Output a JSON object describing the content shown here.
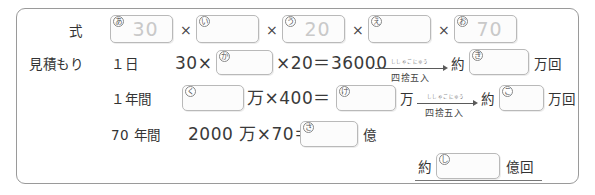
{
  "worksheet": {
    "row_labels": {
      "shiki": "式",
      "mitsumori": "見積もり"
    },
    "rows": [
      {
        "id": "shiki",
        "label": "式",
        "boxes": [
          {
            "tag": "あ",
            "value": "30"
          },
          {
            "tag": "い",
            "value": ""
          },
          {
            "tag": "う",
            "value": "20"
          },
          {
            "tag": "え",
            "value": ""
          },
          {
            "tag": "お",
            "value": "70"
          }
        ],
        "operators": [
          "×",
          "×",
          "×",
          "×"
        ]
      },
      {
        "id": "one-day",
        "period": "１日",
        "expr_a": "30×",
        "box1": {
          "tag": "か",
          "value": ""
        },
        "expr_b": "×20＝36000",
        "arrow_label": "四捨五入",
        "arrow_furigana": "ししゃごにゅう",
        "approx": "約",
        "box2": {
          "tag": "き",
          "value": ""
        },
        "unit": "万回"
      },
      {
        "id": "one-year",
        "period": "１年間",
        "box1": {
          "tag": "く",
          "value": ""
        },
        "expr_a": "万×400＝",
        "box2": {
          "tag": "け",
          "value": ""
        },
        "expr_b": "万",
        "arrow_label": "四捨五入",
        "arrow_furigana": "ししゃごにゅう",
        "approx": "約",
        "box3": {
          "tag": "こ",
          "value": ""
        },
        "unit": "万回"
      },
      {
        "id": "seventy-years",
        "period": "70 年間",
        "expr_a": "2000 万×70＝",
        "box1": {
          "tag": "さ",
          "value": ""
        },
        "unit": "億"
      }
    ],
    "final_answer": {
      "approx": "約",
      "box": {
        "tag": "し",
        "value": ""
      },
      "unit": "億回"
    }
  },
  "colors": {
    "sheet_border": "#9a9a9a",
    "box_border": "#b9b9b9",
    "prefill_text": "#c9c9c9",
    "ink": "#333333"
  }
}
